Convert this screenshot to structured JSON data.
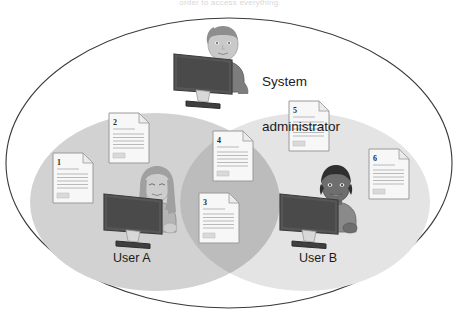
{
  "figure": {
    "caption_top": "order to access everything.",
    "type": "venn-diagram"
  },
  "colors": {
    "outer_outline": "#3a3a3a",
    "page_background": "#ffffff",
    "ellipse_a_fill": "#d2d2d2",
    "ellipse_b_fill": "#e4e4e4",
    "overlap_fill": "#bcbcbc",
    "document_fill": "#f7f7f7",
    "document_outline": "#9a9a9a",
    "document_line": "#b9b9b9",
    "monitor_body": "#5a5a5a",
    "monitor_dark": "#3f3f3f",
    "admin_hair": "#8e8e8e",
    "admin_skin": "#c9c9c9",
    "admin_shirt": "#7d7d7d",
    "usera_hair": "#a0a0a0",
    "usera_skin": "#cdcdcd",
    "usera_shirt": "#b4b4b4",
    "userb_hair": "#2f2f2f",
    "userb_skin": "#6e6e6e",
    "userb_shirt": "#8a8a8a",
    "label_text": "#1b1b1b"
  },
  "regions": {
    "system": {
      "name": "system-boundary",
      "label": ""
    },
    "user_a": {
      "name": "user-a-scope",
      "label": "User A"
    },
    "user_b": {
      "name": "user-b-scope",
      "label": "User B"
    },
    "overlap": {
      "name": "shared-scope",
      "label": ""
    }
  },
  "actors": [
    {
      "id": "admin",
      "label_line1": "System",
      "label_line2": "administrator",
      "region": "system"
    },
    {
      "id": "user_a",
      "label": "User A",
      "region": "user_a"
    },
    {
      "id": "user_b",
      "label": "User B",
      "region": "user_b"
    }
  ],
  "documents": [
    {
      "number": "1",
      "region": "user_a",
      "x": 52,
      "y": 152,
      "w": 42,
      "h": 52
    },
    {
      "number": "2",
      "region": "user_a",
      "x": 108,
      "y": 112,
      "w": 42,
      "h": 52
    },
    {
      "number": "3",
      "region": "overlap",
      "x": 198,
      "y": 192,
      "w": 42,
      "h": 52
    },
    {
      "number": "4",
      "region": "overlap",
      "x": 212,
      "y": 130,
      "w": 42,
      "h": 52
    },
    {
      "number": "5",
      "region": "user_b",
      "x": 288,
      "y": 100,
      "w": 42,
      "h": 52
    },
    {
      "number": "6",
      "region": "user_b",
      "x": 368,
      "y": 148,
      "w": 42,
      "h": 52
    }
  ],
  "doc_line_counts": {
    "header_rule": 1,
    "body_lines": 7,
    "footer_block": 1
  }
}
